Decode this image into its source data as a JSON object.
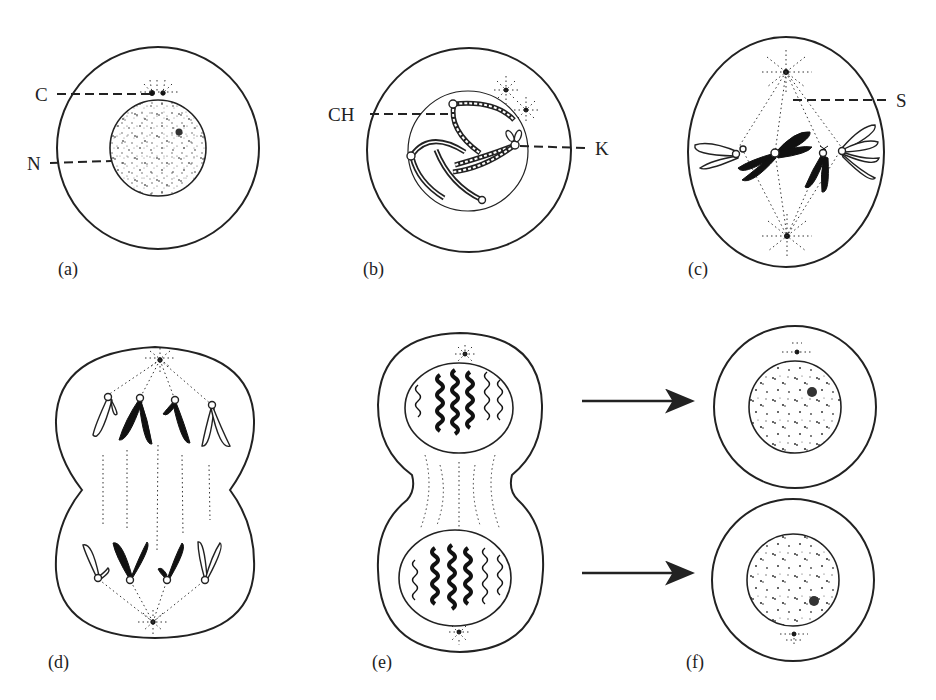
{
  "figure": {
    "panels": [
      {
        "id": "a",
        "caption": "(a)",
        "labels": [
          {
            "text": "C",
            "meaning": "centrioles"
          },
          {
            "text": "N",
            "meaning": "nucleus"
          }
        ]
      },
      {
        "id": "b",
        "caption": "(b)",
        "labels": [
          {
            "text": "CH",
            "meaning": "chromatids"
          },
          {
            "text": "K",
            "meaning": "kinetochore / centromere"
          }
        ]
      },
      {
        "id": "c",
        "caption": "(c)",
        "labels": [
          {
            "text": "S",
            "meaning": "spindle"
          }
        ]
      },
      {
        "id": "d",
        "caption": "(d)",
        "labels": []
      },
      {
        "id": "e",
        "caption": "(e)",
        "labels": []
      },
      {
        "id": "f",
        "caption": "(f)",
        "labels": []
      }
    ],
    "arrows": [
      {
        "from": "e-top",
        "to": "f-top"
      },
      {
        "from": "e-bottom",
        "to": "f-bottom"
      }
    ]
  },
  "colors": {
    "ink": "#222222",
    "background": "#ffffff"
  }
}
